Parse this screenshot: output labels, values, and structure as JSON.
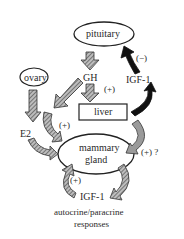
{
  "diagram": {
    "nodes": {
      "pituitary": "pituitary",
      "ovary": "ovary",
      "gh": "GH",
      "liver": "liver",
      "e2": "E2",
      "mammary": "mammary",
      "gland": "gland",
      "igf1_top": "IGF-1",
      "igf1_bottom": "IGF-1"
    },
    "signs": {
      "neg": "(−)",
      "pos_gh_liver": "(+)",
      "pos_e2": "(+)",
      "pos_liver_mammary": "(+) ?",
      "pos_autocrine": "(+)"
    },
    "caption": {
      "line1": "autocrine/paracrine",
      "line2": "responses"
    },
    "colors": {
      "hatched_arrow": "#7a7a7a",
      "black_arrow": "#111111",
      "gray_arrow": "#9a9a9a",
      "outline": "#222222"
    }
  }
}
